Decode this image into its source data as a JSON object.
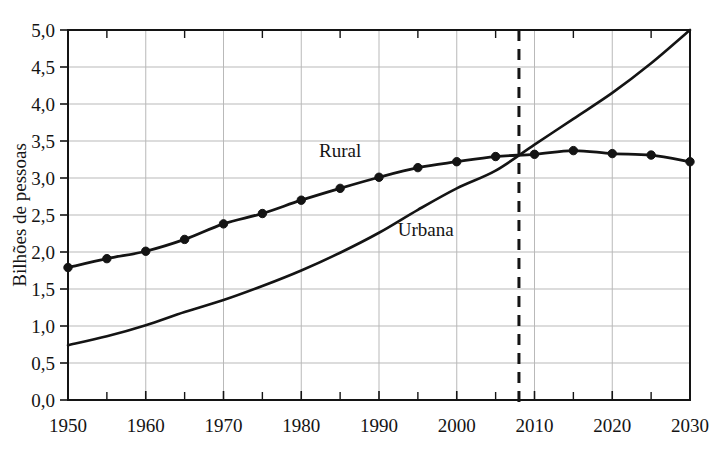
{
  "chart_data": {
    "type": "line",
    "title": "",
    "xlabel": "",
    "ylabel": "Bilhões de pessoas",
    "xlim": [
      1950,
      2030
    ],
    "ylim": [
      0.0,
      5.0
    ],
    "grid": true,
    "legend_position": "inline-annotations",
    "x_tick_labels": [
      "1950",
      "1960",
      "1970",
      "1980",
      "1990",
      "2000",
      "2010",
      "2020",
      "2030"
    ],
    "x_tick_values": [
      1950,
      1960,
      1970,
      1980,
      1990,
      2000,
      2010,
      2020,
      2030
    ],
    "x_minor_tick_values": [
      1955,
      1965,
      1975,
      1985,
      1995,
      2005,
      2015,
      2025
    ],
    "y_tick_labels": [
      "0,0",
      "0,5",
      "1,0",
      "1,5",
      "2,0",
      "2,5",
      "3,0",
      "3,5",
      "4,0",
      "4,5",
      "5,0"
    ],
    "y_tick_values": [
      0.0,
      0.5,
      1.0,
      1.5,
      2.0,
      2.5,
      3.0,
      3.5,
      4.0,
      4.5,
      5.0
    ],
    "x": [
      1950,
      1955,
      1960,
      1965,
      1970,
      1975,
      1980,
      1985,
      1990,
      1995,
      2000,
      2005,
      2010,
      2015,
      2020,
      2025,
      2030
    ],
    "series": [
      {
        "name": "Rural",
        "label": "Rural",
        "color": "#141414",
        "markers": true,
        "values": [
          1.79,
          1.91,
          2.01,
          2.17,
          2.38,
          2.52,
          2.7,
          2.86,
          3.01,
          3.14,
          3.22,
          3.29,
          3.32,
          3.37,
          3.33,
          3.31,
          3.22
        ]
      },
      {
        "name": "Urbana",
        "label": "Urbana",
        "color": "#141414",
        "markers": false,
        "values": [
          0.74,
          0.86,
          1.01,
          1.19,
          1.35,
          1.54,
          1.75,
          1.99,
          2.26,
          2.57,
          2.86,
          3.1,
          3.45,
          3.8,
          4.15,
          4.55,
          5.0
        ]
      }
    ],
    "annotations": [
      {
        "text": "Rural",
        "x_value": 1985,
        "y_value": 3.28
      },
      {
        "text": "Urbana",
        "x_value": 1996,
        "y_value": 2.22
      },
      {
        "type": "vertical-dashed-line",
        "x_value": 2008,
        "text": ""
      }
    ]
  }
}
